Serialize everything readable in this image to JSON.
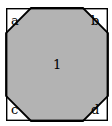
{
  "figure": {
    "canvas": {
      "width": 112,
      "height": 126
    },
    "colors": {
      "background": "#ffffff",
      "outline": "#000000",
      "region_fill": "#b3b3b3",
      "corner_fill": "#ffffff"
    },
    "outer_square": {
      "name": "outer-square",
      "left": 6,
      "top": 8,
      "right": 108,
      "bottom": 121,
      "stroke_width": 1.4
    },
    "octagon": {
      "name": "central-octagon",
      "chamfer": 25,
      "stroke_width": 1.8,
      "points": "31,8 83,8 108,33 108,96 83,121 31,121 6,96 6,33"
    },
    "corners": [
      {
        "id": "a",
        "label": "a",
        "position": "top-left",
        "polygon": "6,8 31,8 6,33"
      },
      {
        "id": "b",
        "label": "b",
        "position": "top-right",
        "polygon": "83,8 108,8 108,33"
      },
      {
        "id": "c",
        "label": "c",
        "position": "bottom-left",
        "polygon": "6,96 6,121 31,121"
      },
      {
        "id": "d",
        "label": "d",
        "position": "bottom-right",
        "polygon": "108,96 108,121 83,121"
      }
    ],
    "regions": [
      {
        "id": "1",
        "label": "1",
        "position": "center",
        "fill": "#b3b3b3"
      }
    ]
  }
}
